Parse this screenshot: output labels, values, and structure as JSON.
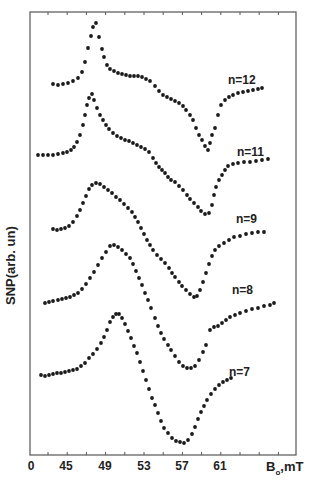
{
  "chart_data": {
    "type": "scatter",
    "title": "",
    "xlabel": "B₀, mT",
    "xlabel_main": "B",
    "xlabel_sub": "o",
    "xlabel_unit": ",mT",
    "ylabel": "SNP(arb. un)",
    "x_tick_labels": [
      "0",
      "45",
      "49",
      "53",
      "57",
      "61"
    ],
    "x_tick_values": [
      null,
      45,
      49,
      53,
      57,
      61
    ],
    "xlim": [
      43,
      68.5
    ],
    "grid": false,
    "legend": "none (inline curve labels)",
    "y_units": "arbitrary, curves vertically offset",
    "series": [
      {
        "name": "n=12",
        "label": "n=12",
        "label_pos": [
          228,
          73
        ],
        "points_px": [
          [
            53,
            84
          ],
          [
            58,
            85
          ],
          [
            63,
            84
          ],
          [
            68,
            83
          ],
          [
            73,
            81
          ],
          [
            78,
            78
          ],
          [
            82,
            72
          ],
          [
            85,
            62
          ],
          [
            88,
            48
          ],
          [
            91,
            36
          ],
          [
            93,
            27
          ],
          [
            96,
            23
          ],
          [
            99,
            37
          ],
          [
            102,
            49
          ],
          [
            104,
            57
          ],
          [
            107,
            65
          ],
          [
            110,
            69
          ],
          [
            114,
            71
          ],
          [
            118,
            73
          ],
          [
            122,
            74
          ],
          [
            126,
            75
          ],
          [
            130,
            76
          ],
          [
            134,
            76
          ],
          [
            138,
            76
          ],
          [
            142,
            77
          ],
          [
            146,
            79
          ],
          [
            150,
            81
          ],
          [
            155,
            86
          ],
          [
            159,
            91
          ],
          [
            163,
            95
          ],
          [
            167,
            97
          ],
          [
            171,
            99
          ],
          [
            175,
            101
          ],
          [
            179,
            103
          ],
          [
            183,
            106
          ],
          [
            186,
            110
          ],
          [
            190,
            115
          ],
          [
            193,
            120
          ],
          [
            196,
            128
          ],
          [
            199,
            135
          ],
          [
            202,
            140
          ],
          [
            205,
            146
          ],
          [
            208,
            150
          ],
          [
            210,
            143
          ],
          [
            212,
            135
          ],
          [
            215,
            128
          ],
          [
            218,
            115
          ],
          [
            221,
            105
          ],
          [
            225,
            100
          ],
          [
            229,
            97
          ],
          [
            233,
            95
          ],
          [
            238,
            93
          ],
          [
            243,
            92
          ],
          [
            248,
            91
          ],
          [
            253,
            90
          ],
          [
            258,
            89
          ],
          [
            262,
            88
          ]
        ],
        "min_field_mT": 59.6,
        "max_field_mT": 48.1
      },
      {
        "name": "n=11",
        "label": "n=11",
        "label_pos": [
          237,
          145
        ],
        "points_px": [
          [
            38,
            155
          ],
          [
            43,
            155
          ],
          [
            48,
            155
          ],
          [
            53,
            155
          ],
          [
            58,
            154
          ],
          [
            63,
            153
          ],
          [
            67,
            152
          ],
          [
            71,
            150
          ],
          [
            74,
            147
          ],
          [
            77,
            142
          ],
          [
            80,
            135
          ],
          [
            83,
            125
          ],
          [
            85,
            115
          ],
          [
            87,
            105
          ],
          [
            89,
            98
          ],
          [
            92,
            94
          ],
          [
            94,
            100
          ],
          [
            97,
            108
          ],
          [
            100,
            115
          ],
          [
            103,
            120
          ],
          [
            106,
            125
          ],
          [
            109,
            129
          ],
          [
            113,
            133
          ],
          [
            117,
            136
          ],
          [
            121,
            138
          ],
          [
            125,
            140
          ],
          [
            129,
            141
          ],
          [
            133,
            143
          ],
          [
            137,
            145
          ],
          [
            141,
            147
          ],
          [
            145,
            149
          ],
          [
            149,
            152
          ],
          [
            153,
            158
          ],
          [
            156,
            163
          ],
          [
            159,
            167
          ],
          [
            162,
            170
          ],
          [
            165,
            173
          ],
          [
            168,
            177
          ],
          [
            171,
            180
          ],
          [
            175,
            182
          ],
          [
            179,
            186
          ],
          [
            183,
            190
          ],
          [
            187,
            195
          ],
          [
            190,
            199
          ],
          [
            194,
            203
          ],
          [
            198,
            207
          ],
          [
            201,
            211
          ],
          [
            205,
            214
          ],
          [
            209,
            213
          ],
          [
            212,
            205
          ],
          [
            214,
            195
          ],
          [
            216,
            187
          ],
          [
            219,
            180
          ],
          [
            222,
            175
          ],
          [
            225,
            170
          ],
          [
            228,
            166
          ],
          [
            233,
            164
          ],
          [
            238,
            163
          ],
          [
            244,
            162
          ],
          [
            250,
            162
          ],
          [
            256,
            161
          ],
          [
            262,
            160
          ],
          [
            268,
            159
          ]
        ],
        "min_field_mT": 59.7,
        "max_field_mT": 47.8
      },
      {
        "name": "n=9",
        "label": "n=9",
        "label_pos": [
          236,
          212
        ],
        "points_px": [
          [
            53,
            229
          ],
          [
            57,
            230
          ],
          [
            61,
            229
          ],
          [
            65,
            228
          ],
          [
            69,
            226
          ],
          [
            73,
            222
          ],
          [
            77,
            216
          ],
          [
            80,
            210
          ],
          [
            83,
            203
          ],
          [
            86,
            196
          ],
          [
            89,
            189
          ],
          [
            92,
            185
          ],
          [
            96,
            183
          ],
          [
            100,
            184
          ],
          [
            104,
            187
          ],
          [
            108,
            190
          ],
          [
            112,
            193
          ],
          [
            116,
            197
          ],
          [
            120,
            200
          ],
          [
            124,
            204
          ],
          [
            128,
            208
          ],
          [
            132,
            212
          ],
          [
            135,
            217
          ],
          [
            138,
            222
          ],
          [
            141,
            228
          ],
          [
            144,
            234
          ],
          [
            147,
            240
          ],
          [
            150,
            245
          ],
          [
            153,
            250
          ],
          [
            157,
            255
          ],
          [
            161,
            259
          ],
          [
            165,
            263
          ],
          [
            169,
            268
          ],
          [
            172,
            273
          ],
          [
            175,
            277
          ],
          [
            179,
            282
          ],
          [
            182,
            286
          ],
          [
            186,
            290
          ],
          [
            190,
            294
          ],
          [
            194,
            297
          ],
          [
            197,
            296
          ],
          [
            200,
            290
          ],
          [
            203,
            282
          ],
          [
            206,
            273
          ],
          [
            209,
            264
          ],
          [
            212,
            256
          ],
          [
            215,
            250
          ],
          [
            219,
            246
          ],
          [
            224,
            243
          ],
          [
            229,
            240
          ],
          [
            234,
            237
          ],
          [
            240,
            236
          ],
          [
            246,
            234
          ],
          [
            252,
            233
          ],
          [
            258,
            232
          ],
          [
            264,
            232
          ]
        ],
        "min_field_mT": 58.8,
        "max_field_mT": 48.2
      },
      {
        "name": "n=8",
        "label": "n=8",
        "label_pos": [
          232,
          283
        ],
        "points_px": [
          [
            45,
            303
          ],
          [
            49,
            302
          ],
          [
            53,
            301
          ],
          [
            58,
            300
          ],
          [
            62,
            299
          ],
          [
            66,
            298
          ],
          [
            70,
            297
          ],
          [
            74,
            295
          ],
          [
            78,
            293
          ],
          [
            82,
            289
          ],
          [
            86,
            284
          ],
          [
            90,
            278
          ],
          [
            94,
            272
          ],
          [
            98,
            265
          ],
          [
            102,
            258
          ],
          [
            106,
            252
          ],
          [
            110,
            246
          ],
          [
            114,
            245
          ],
          [
            118,
            247
          ],
          [
            122,
            250
          ],
          [
            126,
            254
          ],
          [
            130,
            258
          ],
          [
            133,
            264
          ],
          [
            136,
            271
          ],
          [
            139,
            278
          ],
          [
            142,
            285
          ],
          [
            145,
            293
          ],
          [
            148,
            300
          ],
          [
            151,
            308
          ],
          [
            155,
            318
          ],
          [
            158,
            326
          ],
          [
            161,
            333
          ],
          [
            164,
            339
          ],
          [
            168,
            345
          ],
          [
            171,
            350
          ],
          [
            175,
            356
          ],
          [
            179,
            362
          ],
          [
            183,
            366
          ],
          [
            187,
            368
          ],
          [
            191,
            368
          ],
          [
            195,
            366
          ],
          [
            199,
            360
          ],
          [
            203,
            352
          ],
          [
            206,
            345
          ],
          [
            210,
            330
          ],
          [
            214,
            327
          ],
          [
            218,
            326
          ],
          [
            222,
            323
          ],
          [
            226,
            320
          ],
          [
            230,
            317
          ],
          [
            235,
            315
          ],
          [
            240,
            313
          ],
          [
            246,
            311
          ],
          [
            252,
            309
          ],
          [
            258,
            308
          ],
          [
            264,
            306
          ],
          [
            270,
            305
          ],
          [
            274,
            303
          ]
        ],
        "min_field_mT": 58.5,
        "max_field_mT": 49.9
      },
      {
        "name": "n=7",
        "label": "n=7",
        "label_pos": [
          229,
          365
        ],
        "points_px": [
          [
            41,
            375
          ],
          [
            45,
            376
          ],
          [
            49,
            375
          ],
          [
            53,
            374
          ],
          [
            57,
            373
          ],
          [
            61,
            373
          ],
          [
            65,
            372
          ],
          [
            69,
            371
          ],
          [
            73,
            370
          ],
          [
            77,
            369
          ],
          [
            81,
            366
          ],
          [
            85,
            363
          ],
          [
            89,
            358
          ],
          [
            93,
            354
          ],
          [
            97,
            349
          ],
          [
            101,
            343
          ],
          [
            104,
            337
          ],
          [
            107,
            330
          ],
          [
            110,
            322
          ],
          [
            113,
            317
          ],
          [
            116,
            314
          ],
          [
            119,
            314
          ],
          [
            122,
            318
          ],
          [
            125,
            324
          ],
          [
            128,
            331
          ],
          [
            131,
            338
          ],
          [
            134,
            346
          ],
          [
            137,
            353
          ],
          [
            140,
            362
          ],
          [
            143,
            371
          ],
          [
            146,
            380
          ],
          [
            149,
            389
          ],
          [
            152,
            398
          ],
          [
            155,
            405
          ],
          [
            158,
            413
          ],
          [
            161,
            421
          ],
          [
            164,
            428
          ],
          [
            168,
            433
          ],
          [
            172,
            438
          ],
          [
            176,
            441
          ],
          [
            180,
            442
          ],
          [
            184,
            443
          ],
          [
            188,
            440
          ],
          [
            192,
            434
          ],
          [
            195,
            427
          ],
          [
            198,
            419
          ],
          [
            201,
            412
          ],
          [
            204,
            406
          ],
          [
            207,
            400
          ],
          [
            211,
            394
          ],
          [
            215,
            389
          ],
          [
            219,
            385
          ],
          [
            223,
            382
          ],
          [
            227,
            380
          ],
          [
            231,
            378
          ]
        ],
        "min_field_mT": 57.2,
        "max_field_mT": 50.4
      }
    ]
  },
  "axes": {
    "origin_label": "0",
    "frame": {
      "left": 30,
      "top": 12,
      "right": 296,
      "bottom": 455
    }
  },
  "style": {
    "dot_color": "#1a1a1a",
    "axis_color": "#555555",
    "text_color": "#222222"
  }
}
